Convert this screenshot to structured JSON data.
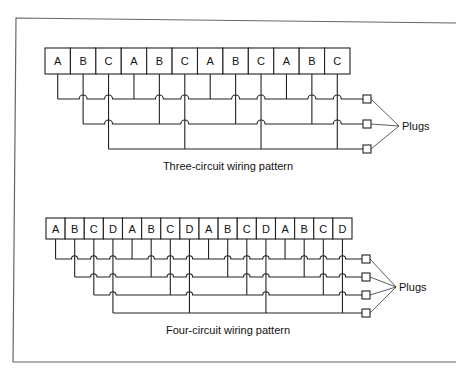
{
  "diagrams": [
    {
      "id": "three",
      "caption": "Three-circuit wiring pattern",
      "boxes": [
        "A",
        "B",
        "C",
        "A",
        "B",
        "C",
        "A",
        "B",
        "C",
        "A",
        "B",
        "C"
      ],
      "circuits": [
        "A",
        "B",
        "C"
      ],
      "plugs_label": "Plugs",
      "geom": {
        "x0": 45,
        "x1": 350,
        "top": 48,
        "bottom": 74,
        "rows": [
          99,
          124,
          149
        ],
        "plug_x": 363,
        "plug_size": 8,
        "conv_x": 399,
        "conv_y": 126,
        "label_x": 402,
        "label_y": 130,
        "cap_x": 228,
        "cap_y": 170
      }
    },
    {
      "id": "four",
      "caption": "Four-circuit wiring pattern",
      "boxes": [
        "A",
        "B",
        "C",
        "D",
        "A",
        "B",
        "C",
        "D",
        "A",
        "B",
        "C",
        "D",
        "A",
        "B",
        "C",
        "D"
      ],
      "circuits": [
        "A",
        "B",
        "C",
        "D"
      ],
      "plugs_label": "Plugs",
      "geom": {
        "x0": 46,
        "x1": 352,
        "top": 218,
        "bottom": 239,
        "rows": [
          259,
          277,
          295,
          313
        ],
        "plug_x": 362,
        "plug_size": 8,
        "conv_x": 396,
        "conv_y": 287,
        "label_x": 399,
        "label_y": 291,
        "cap_x": 228,
        "cap_y": 334
      }
    }
  ]
}
